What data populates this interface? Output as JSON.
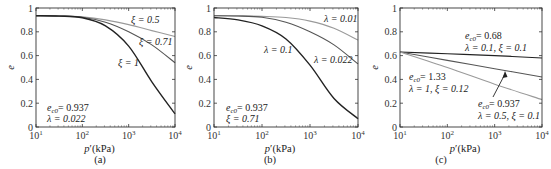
{
  "figure": {
    "panels": [
      {
        "id": "a",
        "caption": "(a)"
      },
      {
        "id": "b",
        "caption": "(b)"
      },
      {
        "id": "c",
        "caption": "(c)"
      }
    ]
  },
  "chart_data": [
    {
      "type": "line",
      "panel": "(a)",
      "xlabel": "p′(kPa)",
      "ylabel": "e",
      "xscale": "log",
      "xlim": [
        10,
        10000
      ],
      "ylim": [
        0,
        1
      ],
      "xticks": [
        "10^1",
        "10^2",
        "10^3",
        "10^4"
      ],
      "yticks": [
        "0",
        "0.2",
        "0.4",
        "0.6",
        "0.8",
        "1"
      ],
      "grid": false,
      "annotation": [
        "e_c0 = 0.937",
        "λ = 0.022"
      ],
      "x": [
        10,
        31.6,
        100,
        316,
        1000,
        3162,
        10000
      ],
      "series": [
        {
          "name": "ξ = 0.5",
          "values": [
            0.935,
            0.934,
            0.925,
            0.9,
            0.86,
            0.81,
            0.76
          ],
          "color": "#9a9a9a"
        },
        {
          "name": "ξ = 0.71",
          "values": [
            0.935,
            0.933,
            0.922,
            0.88,
            0.8,
            0.69,
            0.54
          ],
          "color": "#555555"
        },
        {
          "name": "ξ = 1",
          "values": [
            0.935,
            0.932,
            0.918,
            0.85,
            0.68,
            0.38,
            0.11
          ],
          "color": "#222222"
        }
      ]
    },
    {
      "type": "line",
      "panel": "(b)",
      "xlabel": "p′(kPa)",
      "ylabel": "e",
      "xscale": "log",
      "xlim": [
        10,
        10000
      ],
      "ylim": [
        0,
        1
      ],
      "xticks": [
        "10^1",
        "10^2",
        "10^3",
        "10^4"
      ],
      "yticks": [
        "0",
        "0.2",
        "0.4",
        "0.6",
        "0.8",
        "1"
      ],
      "grid": false,
      "annotation": [
        "e_c0 = 0.937",
        "ξ = 0.71"
      ],
      "x": [
        10,
        31.6,
        100,
        316,
        1000,
        3162,
        10000
      ],
      "series": [
        {
          "name": "λ = 0.01",
          "values": [
            0.935,
            0.934,
            0.93,
            0.92,
            0.89,
            0.83,
            0.73
          ],
          "color": "#9a9a9a"
        },
        {
          "name": "λ = 0.022",
          "values": [
            0.935,
            0.933,
            0.922,
            0.88,
            0.8,
            0.69,
            0.53
          ],
          "color": "#555555"
        },
        {
          "name": "λ = 0.1",
          "values": [
            0.92,
            0.9,
            0.85,
            0.74,
            0.52,
            0.24,
            0.07
          ],
          "color": "#222222"
        }
      ]
    },
    {
      "type": "line",
      "panel": "(c)",
      "xlabel": "p′(kPa)",
      "ylabel": "e",
      "xscale": "log",
      "xlim": [
        10,
        10000
      ],
      "ylim": [
        0,
        1
      ],
      "xticks": [
        "10^1",
        "10^2",
        "10^3",
        "10^4"
      ],
      "yticks": [
        "0",
        "0.2",
        "0.4",
        "0.6",
        "0.8",
        "1"
      ],
      "grid": false,
      "x": [
        10,
        100,
        1000,
        10000
      ],
      "series": [
        {
          "name": "e_c0 = 0.68, λ = 0.1, ξ = 0.1",
          "values": [
            0.63,
            0.615,
            0.6,
            0.58
          ],
          "color": "#222222"
        },
        {
          "name": "e_c0 = 0.937, λ = 0.5, ξ = 0.1",
          "values": [
            0.63,
            0.56,
            0.49,
            0.42
          ],
          "color": "#555555"
        },
        {
          "name": "e_c0 = 1.33, λ = 1, ξ = 0.12",
          "values": [
            0.63,
            0.5,
            0.36,
            0.23
          ],
          "color": "#9a9a9a"
        }
      ]
    }
  ],
  "labels": {
    "a": {
      "curve1": "ξ = 0.5",
      "curve2": "ξ = 0.71",
      "curve3": "ξ = 1",
      "param1_sym": "e",
      "param1_sub": "c0",
      "param1_val": "= 0.937",
      "param2": "λ = 0.022"
    },
    "b": {
      "curve1": "λ = 0.01",
      "curve2": "λ = 0.022",
      "curve3": "λ = 0.1",
      "param1_sym": "e",
      "param1_sub": "c0",
      "param1_val": "= 0.937",
      "param2": "ξ = 0.71"
    },
    "c": {
      "c1_sym": "e",
      "c1_sub": "c0",
      "c1_val": "= 0.68",
      "c1_line2": "λ = 0.1,  ξ = 0.1",
      "c2_sym": "e",
      "c2_sub": "c0",
      "c2_val": "= 1.33",
      "c2_line2": "λ = 1,  ξ = 0.12",
      "c3_sym": "e",
      "c3_sub": "c0",
      "c3_val": "= 0.937",
      "c3_line2": "λ = 0.5,  ξ = 0.1"
    }
  },
  "axes": {
    "ylabel": "e",
    "xlabel_sym": "p",
    "xlabel_rest": "′(kPa)",
    "yticks": [
      "0",
      "0.2",
      "0.4",
      "0.6",
      "0.8",
      "1"
    ],
    "xticks_base": "10",
    "xticks_exp": [
      "1",
      "2",
      "3",
      "4"
    ]
  }
}
